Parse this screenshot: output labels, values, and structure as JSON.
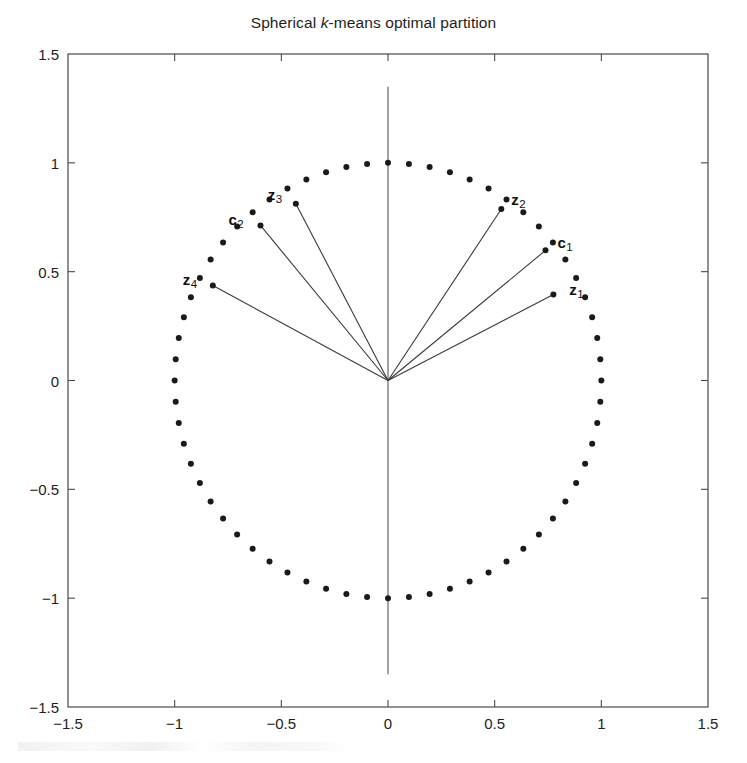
{
  "figure": {
    "title_prefix": "Spherical ",
    "title_italic": "k",
    "title_suffix": "-means optimal partition"
  },
  "chart_data": {
    "type": "scatter",
    "title": "Spherical k-means optimal partition",
    "xlabel": "",
    "ylabel": "",
    "xlim": [
      -1.5,
      1.5
    ],
    "ylim": [
      -1.5,
      1.5
    ],
    "xticks": [
      "-1.5",
      "-1",
      "-0.5",
      "0",
      "0.5",
      "1",
      "1.5"
    ],
    "xtick_values": [
      -1.5,
      -1,
      -0.5,
      0,
      0.5,
      1,
      1.5
    ],
    "yticks": [
      "1.5",
      "1",
      "0.5",
      "0",
      "-0.5",
      "-1",
      "-1.5"
    ],
    "ytick_values": [
      1.5,
      1,
      0.5,
      0,
      -0.5,
      -1,
      -1.5
    ],
    "grid": false,
    "legend": null,
    "aspect": "equal",
    "marker": "dot",
    "marker_color": "#1a1a1a",
    "line_color": "#3a3a3a",
    "data_points": {
      "description": "Unit-circle point cloud: 64 points equally spaced in angle at radius 1",
      "count": 64,
      "radius": 1.0,
      "angle_start_deg": 0,
      "angle_step_deg": 5.625
    },
    "vertical_axis_line": {
      "x": 0,
      "y_from": -1.35,
      "y_to": 1.35
    },
    "rays": [
      {
        "name": "z1",
        "label": "z",
        "subscript": "1",
        "angle_deg": 27.0,
        "radius": 0.87,
        "kind": "data-vector",
        "label_dx": 16,
        "label_dy": -14
      },
      {
        "name": "c1",
        "label": "c",
        "subscript": "1",
        "angle_deg": 39.0,
        "radius": 0.95,
        "kind": "centroid",
        "label_dx": 12,
        "label_dy": -16
      },
      {
        "name": "z2",
        "label": "z",
        "subscript": "2",
        "angle_deg": 56.0,
        "radius": 0.95,
        "kind": "data-vector",
        "label_dx": 10,
        "label_dy": -18
      },
      {
        "name": "z3",
        "label": "z",
        "subscript": "3",
        "angle_deg": 118.0,
        "radius": 0.92,
        "kind": "data-vector",
        "label_dx": -28,
        "label_dy": -18
      },
      {
        "name": "c2",
        "label": "c",
        "subscript": "2",
        "angle_deg": 130.0,
        "radius": 0.93,
        "kind": "centroid",
        "label_dx": -32,
        "label_dy": -14
      },
      {
        "name": "z4",
        "label": "z",
        "subscript": "4",
        "angle_deg": 152.0,
        "radius": 0.93,
        "kind": "data-vector",
        "label_dx": -30,
        "label_dy": -14
      }
    ]
  }
}
